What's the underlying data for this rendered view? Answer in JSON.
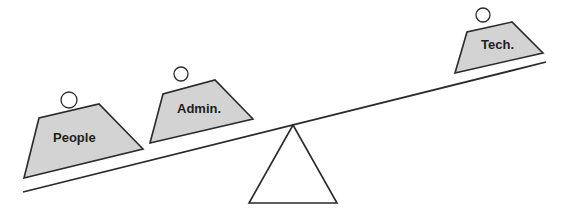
{
  "diagram": {
    "type": "seesaw-balance",
    "colors": {
      "weight_fill": "#d3d3d3",
      "stroke": "#2a2a2a",
      "text": "#1e1e1e",
      "background": "#ffffff"
    },
    "beam": {
      "from": [
        23,
        192
      ],
      "to": [
        546,
        62
      ]
    },
    "fulcrum": {
      "apex": [
        293,
        125
      ],
      "base_left": [
        249,
        203
      ],
      "base_right": [
        337,
        203
      ]
    },
    "weights": [
      {
        "label": "People",
        "side": "left",
        "position": "outer",
        "points": "24,178 143,149 99,104 39,118",
        "handle": {
          "cx": 69,
          "cy": 100,
          "r": 8
        },
        "text_pos": {
          "x": 53,
          "y": 142
        }
      },
      {
        "label": "Admin.",
        "side": "left",
        "position": "inner",
        "points": "150,143 253,119 215,80 163,94",
        "handle": {
          "cx": 181,
          "cy": 74,
          "r": 7
        },
        "text_pos": {
          "x": 177,
          "y": 113
        }
      },
      {
        "label": "Tech.",
        "side": "right",
        "position": "outer",
        "points": "455,73 543,53 512,22 467,32",
        "handle": {
          "cx": 483,
          "cy": 15,
          "r": 7
        },
        "text_pos": {
          "x": 481,
          "y": 49
        }
      }
    ]
  }
}
